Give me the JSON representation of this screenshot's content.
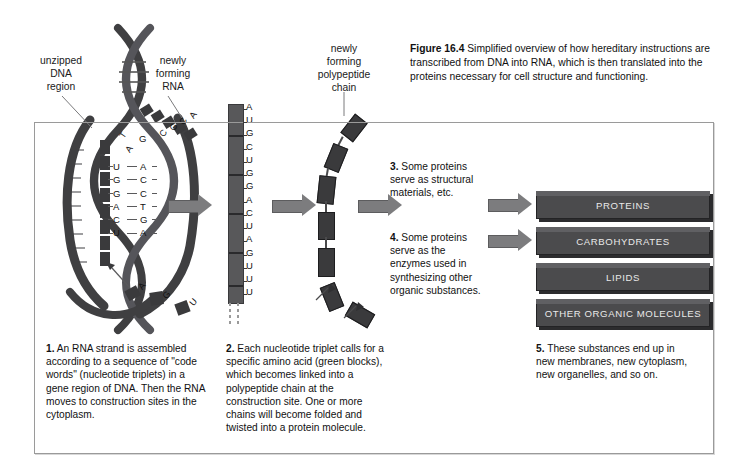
{
  "figure": {
    "number": "Figure 16.4",
    "caption": "Simplified overview of how hereditary instructions are transcribed from DNA into RNA, which is then translated into the proteins necessary for cell structure and functioning."
  },
  "labels": {
    "unzipped_dna": "unzipped\nDNA\nregion",
    "unzipped_dna_line1": "unzipped",
    "unzipped_dna_line2": "DNA",
    "unzipped_dna_line3": "region",
    "newly_forming_rna_line1": "newly",
    "newly_forming_rna_line2": "forming",
    "newly_forming_rna_line3": "RNA",
    "polypeptide_line1": "newly",
    "polypeptide_line2": "forming",
    "polypeptide_line3": "polypeptide",
    "polypeptide_line4": "chain"
  },
  "dna": {
    "rna_bases": [
      "U",
      "G",
      "G",
      "A",
      "C",
      "U"
    ],
    "template_bases": [
      "A",
      "C",
      "C",
      "T",
      "G",
      "A"
    ],
    "upper_bases": [
      "T",
      "A",
      "C",
      "G"
    ],
    "emerging_rna_bases": [
      "C",
      "G",
      "C",
      "A"
    ],
    "free_nucleotides": [
      "A",
      "G",
      "U"
    ]
  },
  "rna_transcript": {
    "bases": [
      "A",
      "U",
      "G",
      "C",
      "U",
      "G",
      "G",
      "A",
      "C",
      "U",
      "A",
      "G",
      "U",
      "U",
      "U"
    ]
  },
  "steps": [
    {
      "number": "1.",
      "text": "An RNA strand is assembled according to a sequence of \"code words\" (nucleotide triplets) in a gene region of DNA. Then the RNA moves to construction sites in the cytoplasm."
    },
    {
      "number": "2.",
      "text": "Each nucleotide triplet calls for a specific amino acid (green blocks), which becomes linked into a polypeptide chain at the construction site. One or more chains will become folded and twisted into a protein molecule."
    },
    {
      "number": "3.",
      "text": "Some proteins serve as structural materials, etc."
    },
    {
      "number": "4.",
      "text": "Some proteins serve as the enzymes used in synthesizing other organic substances."
    },
    {
      "number": "5.",
      "text": "These substances end up in new membranes, new cytoplasm, new organelles, and so on."
    }
  ],
  "products": [
    {
      "label": "PROTEINS"
    },
    {
      "label": "CARBOHYDRATES"
    },
    {
      "label": "LIPIDS"
    },
    {
      "label": "OTHER ORGANIC MOLECULES"
    }
  ],
  "colors": {
    "page_background": "#ffffff",
    "frame_background": "#fdfdfd",
    "frame_border": "#9a9a9a",
    "arrow_fill": "#7c7c7e",
    "bar_fill": "#4b4b4d",
    "bar_text": "#e9e9e9",
    "dna_strand": "#3f3f41",
    "amino_acid_block": "#3a3a3c",
    "text": "#111111"
  }
}
